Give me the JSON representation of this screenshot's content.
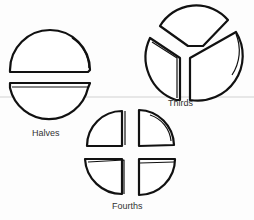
{
  "figure": {
    "groups": [
      {
        "id": "halves",
        "label": "Halves",
        "pieces": 2
      },
      {
        "id": "thirds",
        "label": "Thirds",
        "pieces": 3
      },
      {
        "id": "fourths",
        "label": "Fourths",
        "pieces": 4
      }
    ]
  },
  "colors": {
    "stroke": "#111111",
    "background": "#fdfdfd"
  }
}
